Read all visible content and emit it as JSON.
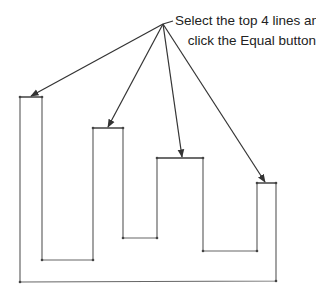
{
  "callout": {
    "line1": "Select the top 4 lines and",
    "line2": "click the Equal button"
  },
  "colors": {
    "stroke": "#555555",
    "arrow": "#333333",
    "text": "#222222"
  },
  "diagram": {
    "shape_points": "20,97 42,97 42,260 93,260 93,128 123,128 123,238 157,238 157,158 203,158 203,251 257,251 257,183 276,183 276,281 20,282 20,97",
    "arrow_origin": [
      163,
      24
    ],
    "arrow_targets": [
      [
        31,
        96
      ],
      [
        108,
        127
      ],
      [
        182,
        157
      ],
      [
        265,
        182
      ]
    ],
    "top_lines": [
      "top-line-1",
      "top-line-2",
      "top-line-3",
      "top-line-4"
    ]
  }
}
